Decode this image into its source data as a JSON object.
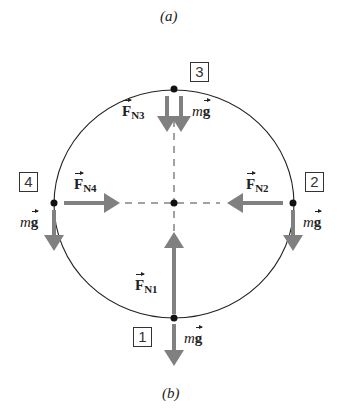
{
  "captions": {
    "top": "(a)",
    "bottom": "(b)"
  },
  "positions": [
    {
      "label": "1",
      "force": "F",
      "sub": "N1"
    },
    {
      "label": "2",
      "force": "F",
      "sub": "N2"
    },
    {
      "label": "3",
      "force": "F",
      "sub": "N3"
    },
    {
      "label": "4",
      "force": "F",
      "sub": "N4"
    }
  ],
  "weight": {
    "m": "m",
    "g": "g"
  },
  "colors": {
    "arrow": "#808080",
    "line": "#222222"
  }
}
